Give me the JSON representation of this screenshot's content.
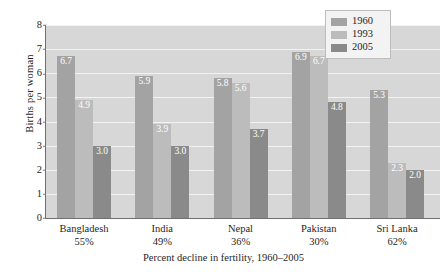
{
  "chart_data": {
    "type": "bar",
    "title": "",
    "xlabel": "Percent decline in fertility,  1960–2005",
    "ylabel": "Births per woman",
    "ylim": [
      0,
      8
    ],
    "ytick_labels": [
      "8",
      "7",
      "6",
      "5",
      "4",
      "3",
      "2",
      "1",
      "0"
    ],
    "grid": true,
    "legend_position": "top-right",
    "categories": [
      "Bangladesh",
      "India",
      "Nepal",
      "Pakistan",
      "Sri Lanka"
    ],
    "category_sublabels": [
      "55%",
      "49%",
      "36%",
      "30%",
      "62%"
    ],
    "series": [
      {
        "name": "1960",
        "color": "#a3a3a3",
        "values": [
          6.7,
          5.9,
          5.8,
          6.9,
          5.3
        ],
        "labels": [
          "6.7",
          "5.9",
          "5.8",
          "6.9",
          "5.3"
        ]
      },
      {
        "name": "1993",
        "color": "#bcbcbc",
        "values": [
          4.9,
          3.9,
          5.6,
          6.7,
          2.3
        ],
        "labels": [
          "4.9",
          "3.9",
          "5.6",
          "6.7",
          "2.3"
        ]
      },
      {
        "name": "2005",
        "color": "#8a8a8a",
        "values": [
          3.0,
          3.0,
          3.7,
          4.8,
          2.0
        ],
        "labels": [
          "3.0",
          "3.0",
          "3.7",
          "4.8",
          "2.0"
        ]
      }
    ],
    "plot_background": "#d7d7d7",
    "gridline_color": "#f2f2f2"
  }
}
